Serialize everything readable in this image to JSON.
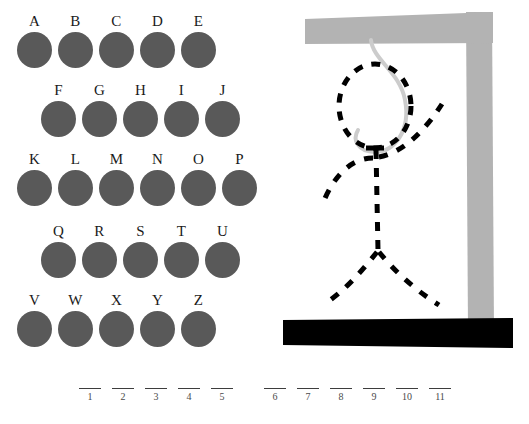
{
  "page": {
    "background_color": "#ffffff"
  },
  "letter_board": {
    "name": "alphabet-selector",
    "disc_color": "#595959",
    "label_color": "#1a1a1a",
    "rows": [
      {
        "indent": 14,
        "top": 14,
        "letters": [
          "A",
          "B",
          "C",
          "D",
          "E"
        ]
      },
      {
        "indent": 38,
        "top": 83,
        "letters": [
          "F",
          "G",
          "H",
          "I",
          "J"
        ]
      },
      {
        "indent": 14,
        "top": 152,
        "letters": [
          "K",
          "L",
          "M",
          "N",
          "O",
          "P"
        ]
      },
      {
        "indent": 38,
        "top": 224,
        "letters": [
          "Q",
          "R",
          "S",
          "T",
          "U"
        ]
      },
      {
        "indent": 14,
        "top": 293,
        "letters": [
          "V",
          "W",
          "X",
          "Y",
          "Z"
        ]
      }
    ]
  },
  "gallows": {
    "name": "hangman-gallows",
    "beam_color": "#b3b3b3",
    "post_color": "#b3b3b3",
    "base_color": "#000000",
    "rope_color": "#cccccc",
    "figure_color": "#000000",
    "figure_style": "dashed",
    "parts_drawn": [
      "head",
      "body",
      "left-arm",
      "right-arm",
      "left-leg",
      "right-leg"
    ],
    "wrong_guesses": 6
  },
  "answer": {
    "name": "answer-blanks",
    "word_groups": [
      {
        "left": 78,
        "slots": [
          "1",
          "2",
          "3",
          "4",
          "5"
        ]
      },
      {
        "left": 263,
        "slots": [
          "6",
          "7",
          "8",
          "9",
          "10",
          "11"
        ]
      }
    ],
    "total_slots": 11,
    "revealed_letters": [
      "",
      "",
      "",
      "",
      "",
      "",
      "",
      "",
      "",
      "",
      ""
    ]
  }
}
